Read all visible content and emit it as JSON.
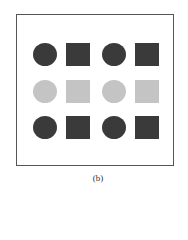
{
  "figure": {
    "caption": "(b)",
    "colors": {
      "dark": "#3a3a3a",
      "light": "#c4c4c4",
      "border": "#555555"
    },
    "grid": {
      "rows": [
        {
          "shade": "dark",
          "shapes": [
            "circle",
            "square",
            "circle",
            "square"
          ]
        },
        {
          "shade": "light",
          "shapes": [
            "circle",
            "square",
            "circle",
            "square"
          ]
        },
        {
          "shade": "dark",
          "shapes": [
            "circle",
            "square",
            "circle",
            "square"
          ]
        }
      ]
    }
  }
}
